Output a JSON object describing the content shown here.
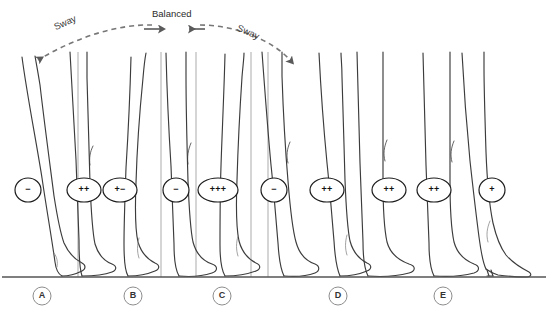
{
  "figure": {
    "background": "#ffffff",
    "stroke_color": "#3c3c3c",
    "guide_color": "#9a9a9a",
    "ground_color": "#555555",
    "arrow_color": "#5a5a5a"
  },
  "annotations": {
    "sway_left": "Sway",
    "balanced": "Balanced",
    "sway_right": "Sway"
  },
  "arc": {
    "style": "dashed",
    "description": "dashed arc spanning from left sway arrow to right sway arrow with two inward arrows at apex labeled Balanced",
    "left_arrow_tip": [
      30,
      63
    ],
    "right_arrow_tip": [
      296,
      66
    ],
    "apex_y": 24
  },
  "panels": [
    {
      "id": "A",
      "label": "A",
      "label_x": 42,
      "label_y": 299,
      "legs": 1
    },
    {
      "id": "B",
      "label": "B",
      "label_x": 133,
      "label_y": 299,
      "legs": 2
    },
    {
      "id": "C",
      "label": "C",
      "label_x": 222,
      "label_y": 299,
      "legs": 2
    },
    {
      "id": "D",
      "label": "D",
      "label_x": 338,
      "label_y": 299,
      "legs": 2
    },
    {
      "id": "E",
      "label": "E",
      "label_x": 443,
      "label_y": 299,
      "legs": 2
    }
  ],
  "badges": [
    {
      "text": "−",
      "cx": 28,
      "cy": 190,
      "rx": 13,
      "ry": 12,
      "panel": "A"
    },
    {
      "text": "++",
      "cx": 84,
      "cy": 190,
      "rx": 17,
      "ry": 12,
      "panel": "B"
    },
    {
      "text": "+−",
      "cx": 120,
      "cy": 190,
      "rx": 17,
      "ry": 12,
      "panel": "B"
    },
    {
      "text": "−",
      "cx": 176,
      "cy": 190,
      "rx": 13,
      "ry": 12,
      "panel": "C"
    },
    {
      "text": "+++",
      "cx": 218,
      "cy": 190,
      "rx": 20,
      "ry": 12,
      "panel": "C"
    },
    {
      "text": "−",
      "cx": 274,
      "cy": 190,
      "rx": 13,
      "ry": 12,
      "panel": "C"
    },
    {
      "text": "++",
      "cx": 327,
      "cy": 190,
      "rx": 17,
      "ry": 12,
      "panel": "D"
    },
    {
      "text": "++",
      "cx": 389,
      "cy": 190,
      "rx": 17,
      "ry": 12,
      "panel": "E"
    },
    {
      "text": "++",
      "cx": 434,
      "cy": 190,
      "rx": 17,
      "ry": 12,
      "panel": "E"
    },
    {
      "text": "+",
      "cx": 492,
      "cy": 190,
      "rx": 13,
      "ry": 12,
      "panel": "E"
    }
  ],
  "guide_lines": [
    {
      "x": 78,
      "y1": 52,
      "y2": 277
    },
    {
      "x": 161,
      "y1": 52,
      "y2": 277
    },
    {
      "x": 196,
      "y1": 52,
      "y2": 277
    },
    {
      "x": 251,
      "y1": 52,
      "y2": 277
    },
    {
      "x": 268,
      "y1": 52,
      "y2": 277
    }
  ],
  "ground": {
    "x1": 2,
    "x2": 546,
    "y": 277
  },
  "legs": [
    {
      "panel": "A",
      "name": "leg-a-1",
      "tilt": "left-lean"
    },
    {
      "panel": "A",
      "name": "leg-a-2",
      "tilt": "upright"
    },
    {
      "panel": "B",
      "name": "leg-b-1",
      "tilt": "slight-left"
    },
    {
      "panel": "B",
      "name": "leg-b-2",
      "tilt": "upright"
    },
    {
      "panel": "C",
      "name": "leg-c-1",
      "tilt": "upright"
    },
    {
      "panel": "C",
      "name": "leg-c-2",
      "tilt": "slight-right"
    },
    {
      "panel": "D",
      "name": "leg-d-1",
      "tilt": "right-lean"
    },
    {
      "panel": "D",
      "name": "leg-d-2",
      "tilt": "upright"
    },
    {
      "panel": "E",
      "name": "leg-e-1",
      "tilt": "upright"
    },
    {
      "panel": "E",
      "name": "leg-e-2-heel",
      "tilt": "high-heel-shoe"
    }
  ]
}
